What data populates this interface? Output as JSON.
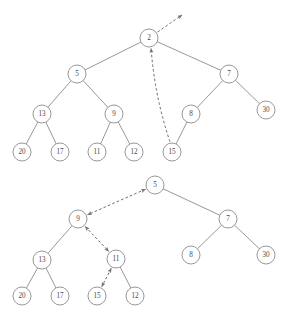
{
  "figure": {
    "caption_clipped": "",
    "width": 291,
    "height": 324,
    "node_radius": 9,
    "colors": {
      "background": "#ffffff",
      "node_stroke": "#8c8c8c",
      "node_fill": "#ffffff",
      "label_text": "#4a4a4a",
      "tree_edge": "#8c8c8c",
      "pointer_edge": "#6e6e6e"
    }
  },
  "diagrams": [
    {
      "id": "tree-before",
      "name": "binary-tree-before",
      "root_value": "2",
      "nodes": [
        {
          "id": "t2",
          "label": "2",
          "x": 149,
          "y": 38
        },
        {
          "id": "t5",
          "label": "5",
          "x": 77,
          "y": 74
        },
        {
          "id": "t7",
          "label": "7",
          "x": 229,
          "y": 74
        },
        {
          "id": "t13",
          "label": "13",
          "x": 42,
          "y": 114
        },
        {
          "id": "t9",
          "label": "9",
          "x": 114,
          "y": 114
        },
        {
          "id": "t8",
          "label": "8",
          "x": 191,
          "y": 114
        },
        {
          "id": "t30",
          "label": "30",
          "x": 266,
          "y": 110
        },
        {
          "id": "t20",
          "label": "20",
          "x": 22,
          "y": 152
        },
        {
          "id": "t17",
          "label": "17",
          "x": 60,
          "y": 152
        },
        {
          "id": "t11",
          "label": "11",
          "x": 97,
          "y": 152
        },
        {
          "id": "t12",
          "label": "12",
          "x": 134,
          "y": 152
        },
        {
          "id": "t15",
          "label": "15",
          "x": 172,
          "y": 152
        }
      ],
      "edges": [
        {
          "from": "t2",
          "to": "t5"
        },
        {
          "from": "t2",
          "to": "t7"
        },
        {
          "from": "t5",
          "to": "t13"
        },
        {
          "from": "t5",
          "to": "t9"
        },
        {
          "from": "t7",
          "to": "t8"
        },
        {
          "from": "t7",
          "to": "t30"
        },
        {
          "from": "t13",
          "to": "t20"
        },
        {
          "from": "t13",
          "to": "t17"
        },
        {
          "from": "t9",
          "to": "t11"
        },
        {
          "from": "t9",
          "to": "t12"
        },
        {
          "from": "t8",
          "to": "t15"
        }
      ],
      "pointers": [
        {
          "name": "pointer-out-of-root",
          "kind": "dashed-arrow",
          "from_node": "t2",
          "to_point": {
            "x": 182,
            "y": 15
          },
          "arrow_at": "end"
        },
        {
          "name": "pointer-15-to-root",
          "kind": "dashed-arrow-curved",
          "from_node": "t15",
          "to_node": "t2",
          "arrow_at": "end",
          "curve_bulge": -6
        }
      ]
    },
    {
      "id": "tree-after",
      "name": "binary-tree-after",
      "root_value": "5",
      "nodes": [
        {
          "id": "b5",
          "label": "5",
          "x": 155,
          "y": 185
        },
        {
          "id": "b9",
          "label": "9",
          "x": 78,
          "y": 219
        },
        {
          "id": "b7",
          "label": "7",
          "x": 228,
          "y": 219
        },
        {
          "id": "b13",
          "label": "13",
          "x": 42,
          "y": 260
        },
        {
          "id": "b11",
          "label": "11",
          "x": 116,
          "y": 259
        },
        {
          "id": "b8",
          "label": "8",
          "x": 191,
          "y": 255
        },
        {
          "id": "b30",
          "label": "30",
          "x": 266,
          "y": 255
        },
        {
          "id": "b20",
          "label": "20",
          "x": 22,
          "y": 296
        },
        {
          "id": "b17",
          "label": "17",
          "x": 60,
          "y": 296
        },
        {
          "id": "b15",
          "label": "15",
          "x": 97,
          "y": 296
        },
        {
          "id": "b12",
          "label": "12",
          "x": 135,
          "y": 296
        }
      ],
      "edges": [
        {
          "from": "b5",
          "to": "b7"
        },
        {
          "from": "b9",
          "to": "b13"
        },
        {
          "from": "b7",
          "to": "b8"
        },
        {
          "from": "b7",
          "to": "b30"
        },
        {
          "from": "b13",
          "to": "b20"
        },
        {
          "from": "b13",
          "to": "b17"
        },
        {
          "from": "b11",
          "to": "b12"
        }
      ],
      "pointers": [
        {
          "name": "pointer-5-to-9",
          "kind": "dashed-double-arrow",
          "from_node": "b5",
          "to_node": "b9",
          "arrow_at": "both"
        },
        {
          "name": "pointer-9-to-11",
          "kind": "dashed-double-arrow",
          "from_node": "b9",
          "to_node": "b11",
          "arrow_at": "both"
        },
        {
          "name": "pointer-11-to-15",
          "kind": "dashed-double-arrow",
          "from_node": "b11",
          "to_node": "b15",
          "arrow_at": "both"
        }
      ]
    }
  ]
}
